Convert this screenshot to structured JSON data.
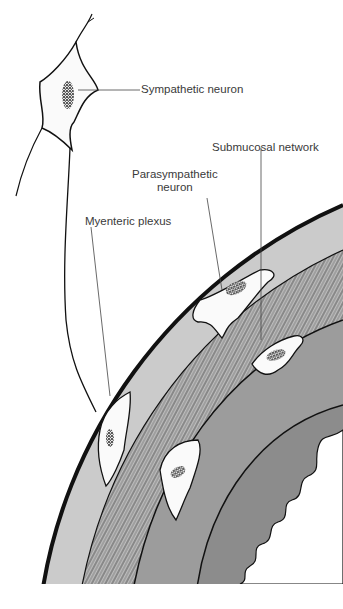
{
  "figure": {
    "labels": {
      "sympathetic_neuron": "Sympathetic neuron",
      "submucosal_network": "Submucosal network",
      "parasympathetic_neuron_line1": "Parasympathetic",
      "parasympathetic_neuron_line2": "neuron",
      "myenteric_plexus": "Myenteric plexus"
    },
    "colors": {
      "background": "#ffffff",
      "serosa": "#c9c9c9",
      "muscle_layer": "#bdbdbd",
      "submucosa": "#9a9a9a",
      "mucosa": "#8a8a8a",
      "neuron_fill": "#f7f7f7",
      "outline": "#111111",
      "label_text": "#3a3a3a"
    }
  }
}
